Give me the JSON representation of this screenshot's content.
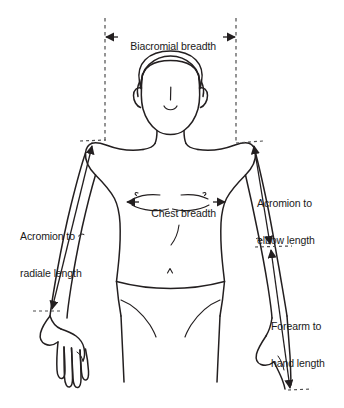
{
  "figure": {
    "line_color": "#231f20",
    "dash_color": "#4d4d4d",
    "background_color": "#ffffff"
  },
  "measurements": [
    {
      "id": "biacromial-breadth",
      "label": "Biacromial breadth",
      "orientation": "horizontal",
      "arrowheads": "both",
      "from": "left acromion",
      "to": "right acromion",
      "guides": "two vertical dashed lines dropping from label to each shoulder"
    },
    {
      "id": "chest-breadth",
      "label": "Chest breadth",
      "orientation": "horizontal",
      "arrowheads": "both",
      "from": "left lateral chest",
      "to": "right lateral chest"
    },
    {
      "id": "acromion-to-radiale-length",
      "label_line_1": "Acromion to",
      "label_line_2": "radiale length",
      "label": "Acromion to radiale length",
      "orientation": "vertical",
      "arrowheads": "both",
      "from": "left acromion",
      "to": "left radiale (elbow)"
    },
    {
      "id": "acromion-to-elbow-length",
      "label_line_1": "Acromion to",
      "label_line_2": "elbow length",
      "label": "Acromion to elbow length",
      "orientation": "vertical",
      "arrowheads": "both",
      "from": "right acromion",
      "to": "right elbow"
    },
    {
      "id": "forearm-to-hand-length",
      "label_line_1": "Forearm to",
      "label_line_2": "hand length",
      "label": "Forearm to hand length",
      "orientation": "vertical",
      "arrowheads": "both",
      "from": "right elbow",
      "to": "right hand tip"
    }
  ],
  "labels": {
    "biacromial": "Biacromial breadth",
    "chest": "Chest breadth",
    "acromion_radiale_1": "Acromion to",
    "acromion_radiale_2": "radiale length",
    "acromion_elbow_1": "Acromion to",
    "acromion_elbow_2": "elbow length",
    "forearm_hand_1": "Forearm to",
    "forearm_hand_2": "hand length"
  }
}
